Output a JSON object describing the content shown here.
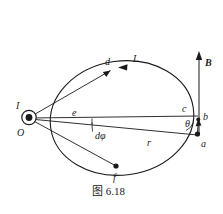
{
  "figure": {
    "caption": "图 6.18",
    "background_color": "#ffffff",
    "ink_color": "#1a1a1a",
    "width": 223,
    "height": 214
  },
  "labels": {
    "current_symbol_label": "I",
    "origin_label": "O",
    "point_d": "d",
    "loop_label": "L",
    "point_e": "e",
    "point_c": "c",
    "point_b": "b",
    "point_a": "a",
    "point_f": "f",
    "angle_theta": "θ",
    "angle_dphi": "dφ",
    "radius_r": "r",
    "field_B": "B"
  },
  "icons": {
    "current_out_of_page": "circle-dot-icon",
    "field_arrow": "up-arrow-icon",
    "loop_direction_arrow": "left-arrowhead-icon",
    "tangent_arrow": "up-arrowhead-icon"
  }
}
